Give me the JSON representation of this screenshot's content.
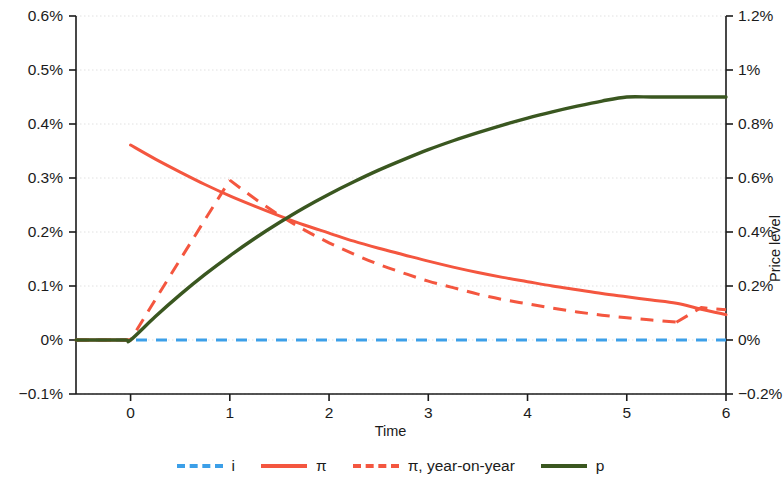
{
  "chart_data": {
    "type": "line",
    "title": "",
    "xlabel": "Time",
    "ylabel_left": "",
    "ylabel_right": "Price level",
    "xlim": [
      -0.55,
      6.0
    ],
    "xticks": [
      0,
      1,
      2,
      3,
      4,
      5,
      6
    ],
    "xticklabels": [
      "0",
      "1",
      "2",
      "3",
      "4",
      "5",
      "6"
    ],
    "ylim_left": [
      -0.1,
      0.6
    ],
    "yticks_left": [
      -0.1,
      0,
      0.1,
      0.2,
      0.3,
      0.4,
      0.5,
      0.6
    ],
    "yticklabels_left": [
      "−0.1%",
      "0%",
      "0.1%",
      "0.2%",
      "0.3%",
      "0.4%",
      "0.5%",
      "0.6%"
    ],
    "ylim_right": [
      -0.2,
      1.2
    ],
    "yticks_right": [
      -0.2,
      0,
      0.2,
      0.4,
      0.6,
      0.8,
      1.0,
      1.2
    ],
    "yticklabels_right": [
      "−0.2%",
      "0%",
      "0.2%",
      "0.4%",
      "0.6%",
      "0.8%",
      "1%",
      "1.2%"
    ],
    "grid": true,
    "legend_position": "below",
    "series": [
      {
        "name": "i",
        "label": "i",
        "color": "#3C9FE8",
        "style": "dashed",
        "axis": "left",
        "x": [
          -0.55,
          -0.4,
          -0.2,
          0,
          0.5,
          1,
          1.5,
          2,
          2.5,
          3,
          3.5,
          4,
          4.5,
          5,
          5.5,
          6
        ],
        "values": [
          0,
          0,
          0,
          0,
          0,
          0,
          0,
          0,
          0,
          0,
          0,
          0,
          0,
          0,
          0,
          0
        ]
      },
      {
        "name": "pi",
        "label": "π",
        "color": "#F4563F",
        "style": "solid",
        "axis": "left",
        "x": [
          -0.55,
          -0.3,
          -0.05,
          0,
          0.25,
          0.5,
          0.75,
          1,
          1.25,
          1.5,
          1.75,
          2,
          2.25,
          2.5,
          2.75,
          3,
          3.25,
          3.5,
          3.75,
          4,
          4.25,
          4.5,
          4.75,
          5,
          5.25,
          5.5,
          5.75,
          6
        ],
        "values": [
          0,
          0,
          0,
          0.361,
          0.335,
          0.311,
          0.288,
          0.267,
          0.248,
          0.23,
          0.213,
          0.198,
          0.183,
          0.17,
          0.158,
          0.146,
          0.135,
          0.125,
          0.116,
          0.108,
          0.1,
          0.093,
          0.086,
          0.08,
          0.074,
          0.068,
          0.057,
          0.047
        ]
      },
      {
        "name": "pi_yoy",
        "label": "π, year-on-year",
        "color": "#F4563F",
        "style": "dashed",
        "axis": "left",
        "x": [
          -0.55,
          -0.3,
          -0.05,
          0,
          0.25,
          0.5,
          0.75,
          1,
          1.25,
          1.5,
          1.75,
          2,
          2.25,
          2.5,
          2.75,
          3,
          3.25,
          3.5,
          3.75,
          4,
          4.25,
          4.5,
          4.75,
          5,
          5.25,
          5.5,
          5.75,
          6
        ],
        "values": [
          0,
          0,
          0,
          0,
          0.075,
          0.149,
          0.223,
          0.296,
          0.262,
          0.231,
          0.204,
          0.18,
          0.159,
          0.14,
          0.124,
          0.109,
          0.097,
          0.085,
          0.075,
          0.067,
          0.059,
          0.052,
          0.046,
          0.041,
          0.037,
          0.033,
          0.06,
          0.056
        ]
      },
      {
        "name": "p",
        "label": "p",
        "color": "#3A5720",
        "style": "solid",
        "axis": "right",
        "x": [
          -0.55,
          -0.3,
          -0.05,
          0,
          0.25,
          0.5,
          0.75,
          1,
          1.25,
          1.5,
          1.75,
          2,
          2.25,
          2.5,
          2.75,
          3,
          3.25,
          3.5,
          3.75,
          4,
          4.25,
          4.5,
          4.75,
          5,
          5.25,
          5.5,
          5.75,
          6
        ],
        "values": [
          0,
          0,
          0,
          0,
          0.087,
          0.168,
          0.243,
          0.312,
          0.376,
          0.435,
          0.49,
          0.54,
          0.586,
          0.629,
          0.668,
          0.705,
          0.738,
          0.768,
          0.796,
          0.822,
          0.845,
          0.866,
          0.885,
          0.9,
          0.9,
          0.9,
          0.9,
          0.9
        ]
      }
    ]
  },
  "legend": {
    "items": [
      {
        "label": "i",
        "color": "#3C9FE8",
        "style": "dashed"
      },
      {
        "label": "π",
        "color": "#F4563F",
        "style": "solid"
      },
      {
        "label": "π, year-on-year",
        "color": "#F4563F",
        "style": "dashed"
      },
      {
        "label": "p",
        "color": "#3A5720",
        "style": "solid"
      }
    ]
  },
  "axes": {
    "x_title": "Time",
    "y_right_title": "Price level"
  }
}
